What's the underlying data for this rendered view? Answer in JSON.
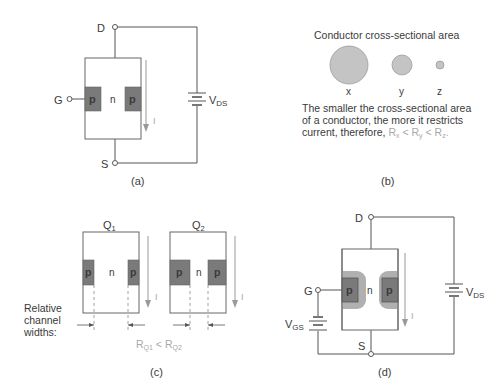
{
  "colors": {
    "wire": "#555555",
    "p_region": "#7a7a7a",
    "depletion": "#b0b0b0",
    "arrow": "#999999",
    "circle_fill": "#c4c4c4",
    "circle_stroke": "#9a9a9a",
    "highlight_text": "#a8a8a8",
    "text": "#3a3a3a"
  },
  "panel_a": {
    "caption": "(a)",
    "terminals": {
      "drain": "D",
      "gate": "G",
      "source": "S"
    },
    "regions": {
      "p_left": "p",
      "n": "n",
      "p_right": "p"
    },
    "current_label": "I",
    "battery": {
      "label_main": "V",
      "label_sub": "DS"
    }
  },
  "panel_b": {
    "caption": "(b)",
    "title": "Conductor cross-sectional area",
    "circles": [
      {
        "label": "x",
        "size": "large"
      },
      {
        "label": "y",
        "size": "medium"
      },
      {
        "label": "z",
        "size": "small"
      }
    ],
    "explanation": {
      "line1": "The smaller the cross-sectional area",
      "line2": "of a conductor, the more it restricts",
      "line3_prefix": "current, therefore, ",
      "relation": {
        "r": "R",
        "sub_x": "x",
        "sub_y": "y",
        "sub_z": "z",
        "lt": "<",
        "end": "."
      }
    }
  },
  "panel_c": {
    "caption": "(c)",
    "transistors": [
      {
        "label_main": "Q",
        "label_sub": "1",
        "regions": {
          "p_left": "p",
          "n": "n",
          "p_right": "p"
        },
        "current_label": "I"
      },
      {
        "label_main": "Q",
        "label_sub": "2",
        "regions": {
          "p_left": "p",
          "n": "n",
          "p_right": "p"
        },
        "current_label": "I"
      }
    ],
    "side_label": {
      "line1": "Relative",
      "line2": "channel",
      "line3": "widths:"
    },
    "relation": {
      "r": "R",
      "sub1": "Q1",
      "lt": "<",
      "sub2": "Q2"
    }
  },
  "panel_d": {
    "caption": "(d)",
    "terminals": {
      "drain": "D",
      "gate": "G",
      "source": "S"
    },
    "regions": {
      "p_left": "p",
      "n": "n",
      "p_right": "p"
    },
    "current_label": "I",
    "battery_ds": {
      "label_main": "V",
      "label_sub": "DS"
    },
    "battery_gs": {
      "label_main": "V",
      "label_sub": "GS"
    }
  }
}
